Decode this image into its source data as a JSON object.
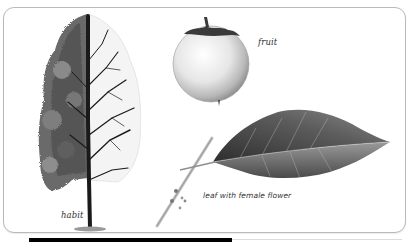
{
  "figure": {
    "panels": [
      {
        "id": "habit",
        "label": "habit",
        "icon": "tree-icon"
      },
      {
        "id": "fruit",
        "label": "fruit",
        "icon": "fruit-icon"
      },
      {
        "id": "leaf",
        "label": "leaf with female flower",
        "icon": "leaf-icon"
      }
    ]
  },
  "colors": {
    "border": "#b9b9b9",
    "ink": "#1a1a1a",
    "foliage": "#6e6e6e",
    "label": "#333333"
  }
}
